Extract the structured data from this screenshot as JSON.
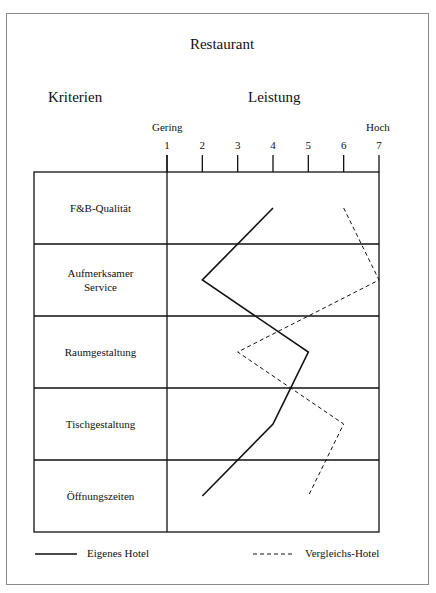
{
  "title": "Restaurant",
  "headers": {
    "criteria": "Kriterien",
    "performance": "Leistung"
  },
  "axis": {
    "low_label": "Gering",
    "high_label": "Hoch"
  },
  "legend": {
    "own": "Eigenes Hotel",
    "compare": "Vergleichs-Hotel"
  },
  "chart_data": {
    "type": "line",
    "title": "Restaurant",
    "orientation": "horizontal-profile",
    "xlabel": "Leistung",
    "ylabel": "Kriterien",
    "x_range": [
      1,
      7
    ],
    "x_ticks": [
      1,
      2,
      3,
      4,
      5,
      6,
      7
    ],
    "x_low_label": "Gering",
    "x_high_label": "Hoch",
    "categories": [
      "F&B-Qualität",
      "Aufmerksamer Service",
      "Raumgestaltung",
      "Tischgestaltung",
      "Öffnungszeiten"
    ],
    "series": [
      {
        "name": "Eigenes Hotel",
        "style": "solid",
        "values": [
          4,
          2,
          5,
          4,
          2
        ]
      },
      {
        "name": "Vergleichs-Hotel",
        "style": "dashed",
        "values": [
          6,
          7,
          3,
          6,
          5
        ]
      }
    ],
    "legend_position": "bottom",
    "grid": "row separators"
  }
}
